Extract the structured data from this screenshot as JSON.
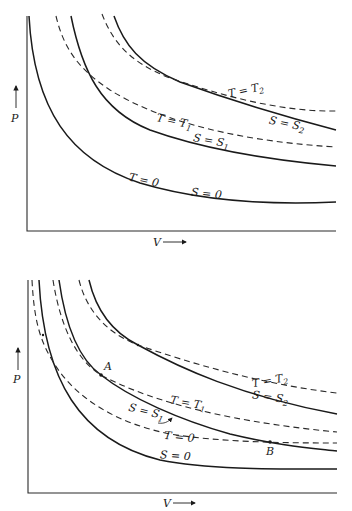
{
  "diagrams": [
    {
      "id": "top",
      "axis_labels": {
        "y": "P",
        "x": "V"
      },
      "curves": [
        {
          "name": "T = 0",
          "style": "solid",
          "label_T": "T = 0",
          "label_S": "S = 0",
          "note": "T=0 isotherm coincides with S=0 adiabat"
        },
        {
          "name": "S = S1",
          "style": "solid",
          "label": "S = S",
          "sub": "1"
        },
        {
          "name": "T = T1",
          "style": "dashed",
          "label": "T = T",
          "sub": "1"
        },
        {
          "name": "S = S2",
          "style": "solid",
          "label": "S = S",
          "sub": "2"
        },
        {
          "name": "T = T2",
          "style": "dashed",
          "label": "T = T",
          "sub": "2"
        }
      ]
    },
    {
      "id": "bottom",
      "axis_labels": {
        "y": "P",
        "x": "V"
      },
      "curves": [
        {
          "name": "S = 0",
          "style": "solid",
          "label": "S = 0"
        },
        {
          "name": "T = 0",
          "style": "dashed",
          "label": "T = 0"
        },
        {
          "name": "S = S1",
          "style": "solid",
          "label": "S = S",
          "sub": "1"
        },
        {
          "name": "T = T1",
          "style": "dashed",
          "label": "T = T",
          "sub": "1"
        },
        {
          "name": "S = S2",
          "style": "solid",
          "label": "S = S",
          "sub": "2"
        },
        {
          "name": "T = T2",
          "style": "dashed",
          "label": "T = T",
          "sub": "2"
        }
      ],
      "points": [
        {
          "label": "A"
        },
        {
          "label": "B"
        }
      ]
    }
  ],
  "labels": {
    "P": "P",
    "V": "V",
    "T_eq": "T = T",
    "S_eq": "S = S",
    "T0": "T = 0",
    "S0": "S = 0",
    "sub1": "1",
    "sub2": "2",
    "A": "A",
    "B": "B"
  }
}
